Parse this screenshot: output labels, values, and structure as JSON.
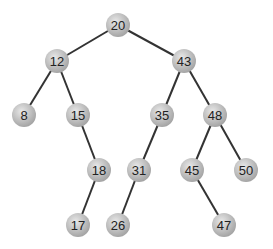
{
  "diagram": {
    "type": "binary-search-tree",
    "node_radius": 12,
    "colors": {
      "node_fill_light": "#e4e4e4",
      "node_fill_dark": "#a9a9a9",
      "edge": "#333333",
      "text": "#222222",
      "background": "#ffffff"
    },
    "nodes": [
      {
        "id": "n20",
        "label": "20",
        "x": 118,
        "y": 25
      },
      {
        "id": "n12",
        "label": "12",
        "x": 57,
        "y": 61
      },
      {
        "id": "n43",
        "label": "43",
        "x": 184,
        "y": 61
      },
      {
        "id": "n8",
        "label": "8",
        "x": 24,
        "y": 115
      },
      {
        "id": "n15",
        "label": "15",
        "x": 78,
        "y": 115
      },
      {
        "id": "n35",
        "label": "35",
        "x": 162,
        "y": 115
      },
      {
        "id": "n48",
        "label": "48",
        "x": 215,
        "y": 115
      },
      {
        "id": "n18",
        "label": "18",
        "x": 99,
        "y": 170
      },
      {
        "id": "n31",
        "label": "31",
        "x": 139,
        "y": 170
      },
      {
        "id": "n45",
        "label": "45",
        "x": 192,
        "y": 170
      },
      {
        "id": "n50",
        "label": "50",
        "x": 246,
        "y": 170
      },
      {
        "id": "n17",
        "label": "17",
        "x": 78,
        "y": 225
      },
      {
        "id": "n26",
        "label": "26",
        "x": 118,
        "y": 225
      },
      {
        "id": "n47",
        "label": "47",
        "x": 224,
        "y": 225
      }
    ],
    "edges": [
      {
        "from": "n20",
        "to": "n12"
      },
      {
        "from": "n20",
        "to": "n43"
      },
      {
        "from": "n12",
        "to": "n8"
      },
      {
        "from": "n12",
        "to": "n15"
      },
      {
        "from": "n43",
        "to": "n35"
      },
      {
        "from": "n43",
        "to": "n48"
      },
      {
        "from": "n15",
        "to": "n18"
      },
      {
        "from": "n35",
        "to": "n31"
      },
      {
        "from": "n48",
        "to": "n45"
      },
      {
        "from": "n48",
        "to": "n50"
      },
      {
        "from": "n18",
        "to": "n17"
      },
      {
        "from": "n31",
        "to": "n26"
      },
      {
        "from": "n45",
        "to": "n47"
      }
    ]
  }
}
